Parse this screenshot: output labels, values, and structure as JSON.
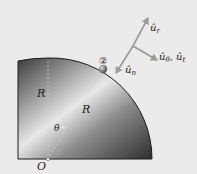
{
  "diagram": {
    "labels": {
      "R_vertical": "R",
      "R_radial": "R",
      "theta": "θ",
      "origin": "O",
      "point": "②",
      "u_r": "û",
      "u_r_sub": "r",
      "u_theta": "û",
      "u_theta_sub": "θ",
      "comma": ", ",
      "u_t": "û",
      "u_t_sub": "t",
      "u_n": "û",
      "u_n_sub": "n"
    },
    "colors": {
      "background": "#ecebe9",
      "arrow": "#9a9a9a",
      "outline": "#1a1a1a"
    }
  }
}
